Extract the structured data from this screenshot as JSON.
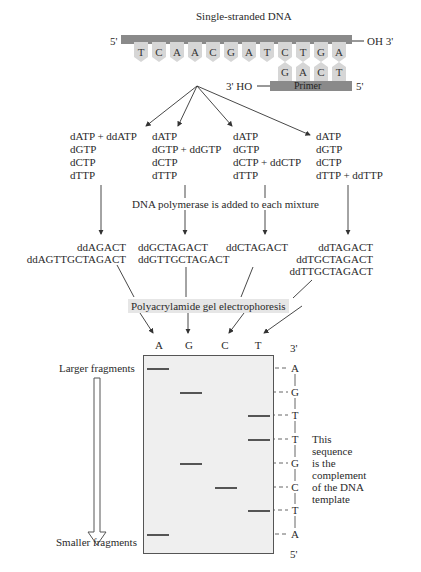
{
  "template": {
    "title": "Single-stranded DNA",
    "five_prime_label": "5'",
    "three_prime_label": "OH 3'",
    "bases": [
      "T",
      "C",
      "A",
      "A",
      "C",
      "G",
      "A",
      "T",
      "C",
      "T",
      "G",
      "A"
    ],
    "strand_color": "#8a8a8a",
    "base_color": "#d6d6d6"
  },
  "primer": {
    "label": "Primer",
    "three_prime_label": "3' HO",
    "five_prime_label": "5'",
    "bases": [
      "G",
      "A",
      "C",
      "T"
    ]
  },
  "mixtures": [
    {
      "lines": [
        "dATP + ddATP",
        "dGTP",
        "dCTP",
        "dTTP"
      ]
    },
    {
      "lines": [
        "dATP",
        "dGTP + ddGTP",
        "dCTP",
        "dTTP"
      ]
    },
    {
      "lines": [
        "dATP",
        "dGTP",
        "dCTP + ddCTP",
        "dTTP"
      ]
    },
    {
      "lines": [
        "dATP",
        "dGTP",
        "dCTP",
        "dTTP + ddTTP"
      ]
    }
  ],
  "polymerase_step": "DNA polymerase is added to each mixture",
  "fragments": [
    {
      "lines": [
        "ddAGACT",
        "ddAGTTGCTAGACT"
      ]
    },
    {
      "lines": [
        "ddGCTAGACT",
        "ddGTTGCTAGACT"
      ]
    },
    {
      "lines": [
        "ddCTAGACT"
      ]
    },
    {
      "lines": [
        "ddTAGACT",
        "ddTGCTAGACT",
        "ddTTGCTAGACT"
      ]
    }
  ],
  "electrophoresis_step": "Polyacrylamide gel electrophoresis",
  "gel": {
    "lanes": [
      "A",
      "G",
      "C",
      "T"
    ],
    "top_label": "3'",
    "bottom_label": "5'",
    "larger_label": "Larger fragments",
    "smaller_label": "Smaller fragments",
    "read_sequence": [
      "A",
      "G",
      "T",
      "T",
      "G",
      "C",
      "T",
      "A"
    ],
    "band_lanes": [
      0,
      1,
      3,
      3,
      1,
      2,
      3,
      0
    ],
    "band_color": "#555555",
    "gel_color": "#efefef"
  },
  "annotation": {
    "lines": [
      "This",
      "sequence",
      "is the",
      "complement",
      "of the DNA",
      "template"
    ]
  }
}
